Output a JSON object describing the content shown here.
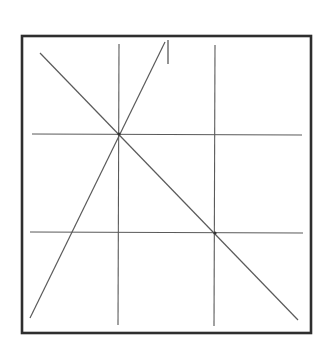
{
  "diagram": {
    "type": "geometry-grid",
    "background": "#ffffff",
    "frame": {
      "x1": 22,
      "y1": 36,
      "x2": 311,
      "y2": 333,
      "stroke": "#2e2e2e",
      "width": 2.6
    },
    "line_color": "#5a5a5a",
    "grid": {
      "horizontal": [
        {
          "x1": 32,
          "y1": 134,
          "x2": 302,
          "y2": 135
        },
        {
          "x1": 30,
          "y1": 232,
          "x2": 303,
          "y2": 233
        }
      ],
      "vertical": [
        {
          "x1": 119,
          "y1": 44,
          "x2": 118,
          "y2": 325
        },
        {
          "x1": 215,
          "y1": 45,
          "x2": 214,
          "y2": 326
        }
      ]
    },
    "diagonals": [
      {
        "name": "falling-diagonal",
        "x1": 40,
        "y1": 53,
        "x2": 298,
        "y2": 320
      },
      {
        "name": "steep-line",
        "x1": 30,
        "y1": 318,
        "x2": 165,
        "y2": 42
      }
    ],
    "tick": {
      "x1": 168,
      "y1": 40,
      "x2": 168,
      "y2": 64
    },
    "intersection_points": [
      {
        "x": 119,
        "y": 134
      },
      {
        "x": 215,
        "y": 233
      }
    ]
  }
}
